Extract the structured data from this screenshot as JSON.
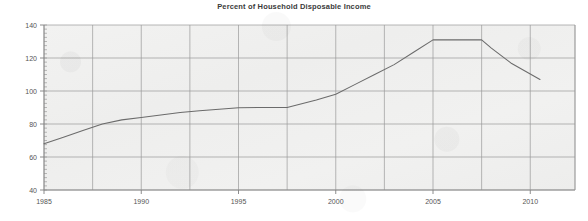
{
  "chart_data": {
    "type": "line",
    "title": "Percent of Household Disposable Income",
    "xlabel": "",
    "ylabel": "",
    "xlim": [
      1985,
      2012.3
    ],
    "ylim": [
      40,
      140
    ],
    "grid": true,
    "legend": "none",
    "y_ticks": [
      40,
      60,
      80,
      100,
      120,
      140
    ],
    "y_tick_labels": [
      "40",
      "60",
      "80",
      "100",
      "120",
      "140"
    ],
    "x_ticks": [
      1985,
      1990,
      1995,
      2000,
      2005,
      2010
    ],
    "x_tick_labels": [
      "1985",
      "1990",
      "1995",
      "2000",
      "2005",
      "2010"
    ],
    "x_gridlines": [
      1985,
      1987.5,
      1990,
      1992.5,
      1995,
      1997.5,
      2000,
      2002.5,
      2005,
      2007.5,
      2010,
      2012.3
    ],
    "series": [
      {
        "name": "Household debt",
        "color": "#6b6b6b",
        "x": [
          1985,
          1986,
          1987,
          1988,
          1989,
          1990,
          1991,
          1992,
          1993,
          1994,
          1995,
          1996,
          1997.5,
          1998,
          1999,
          2000,
          2001,
          2002,
          2003,
          2004,
          2005,
          2006,
          2007.5,
          2008,
          2009,
          2010.5
        ],
        "values": [
          68,
          72,
          76,
          80,
          82.5,
          84,
          85.5,
          87,
          88,
          89,
          89.8,
          90,
          90,
          91.5,
          94.5,
          98,
          104,
          110,
          116,
          123.5,
          131,
          131,
          131,
          126,
          117,
          107
        ]
      }
    ]
  },
  "axes": {
    "y_axis_name": "y-axis",
    "x_axis_name": "x-axis"
  }
}
